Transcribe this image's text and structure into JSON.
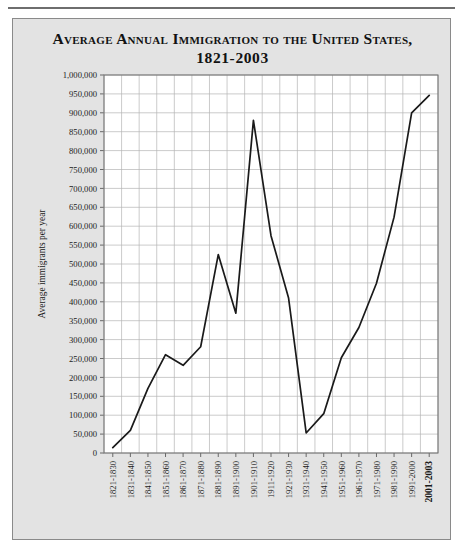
{
  "figure": {
    "background_color": "#e3e3e3",
    "plot_background_color": "#ffffff",
    "border_color": "#8a8a8a",
    "rule_color": "#6e6e6e"
  },
  "title": {
    "line1": "Average Annual Immigration to the United States,",
    "line2": "1821-2003"
  },
  "chart_data": {
    "type": "line",
    "title": "Average Annual Immigration to the United States, 1821-2003",
    "xlabel": "",
    "ylabel": "Average immigrants per year",
    "ylim": [
      0,
      1000000
    ],
    "ytick_step": 50000,
    "grid": true,
    "legend": false,
    "line_color": "#1a1a1a",
    "categories": [
      "1821-1830",
      "1831-1840",
      "1841-1850",
      "1851-1860",
      "1861-1870",
      "1871-1880",
      "1881-1890",
      "1891-1900",
      "1901-1910",
      "1911-1920",
      "1921-1930",
      "1931-1940",
      "1941-1950",
      "1951-1960",
      "1961-1970",
      "1971-1980",
      "1981-1990",
      "1991-2000",
      "2001-2003"
    ],
    "values": [
      14000,
      60000,
      171000,
      260000,
      232000,
      281000,
      525000,
      370000,
      880000,
      575000,
      410000,
      53000,
      104000,
      252000,
      332000,
      449000,
      624000,
      900000,
      946000
    ],
    "ytick_labels": [
      "1,000,000",
      "950,000",
      "900,000",
      "850,000",
      "800,000",
      "750,000",
      "700,000",
      "650,000",
      "600,000",
      "550,000",
      "500,000",
      "450,000",
      "400,000",
      "350,000",
      "300,000",
      "250,000",
      "200,000",
      "150,000",
      "100,000",
      "50,000",
      "0"
    ],
    "ytick_values": [
      1000000,
      950000,
      900000,
      850000,
      800000,
      750000,
      700000,
      650000,
      600000,
      550000,
      500000,
      450000,
      400000,
      350000,
      300000,
      250000,
      200000,
      150000,
      100000,
      50000,
      0
    ]
  }
}
